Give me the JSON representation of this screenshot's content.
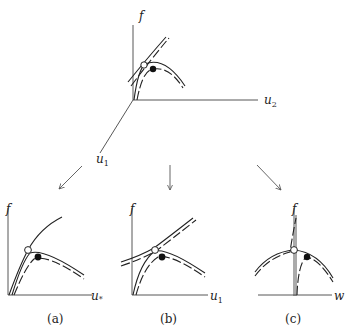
{
  "top_panel": {
    "axis_f": "f",
    "axis_u2": "u",
    "axis_u2_sub": "2",
    "axis_u1": "u",
    "axis_u1_sub": "1",
    "markers": [
      "open-circle",
      "filled-circle"
    ]
  },
  "panels": [
    {
      "id": "a",
      "caption": "(a)",
      "axis_y": "f",
      "axis_x": "u",
      "axis_x_sub": "*"
    },
    {
      "id": "b",
      "caption": "(b)",
      "axis_y": "f",
      "axis_x": "u",
      "axis_x_sub": "1"
    },
    {
      "id": "c",
      "caption": "(c)",
      "axis_y": "f",
      "axis_x": "w",
      "axis_x_sub": ""
    }
  ],
  "arrows": [
    "to-panel-a",
    "to-panel-b",
    "to-panel-c"
  ]
}
